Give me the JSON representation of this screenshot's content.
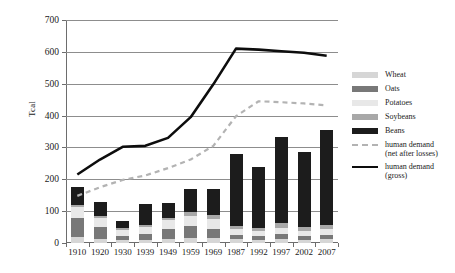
{
  "chart_data": {
    "type": "bar",
    "title": "",
    "xlabel": "",
    "ylabel": "Tcal",
    "ylim": [
      0,
      700
    ],
    "yticks": [
      0,
      100,
      200,
      300,
      400,
      500,
      600,
      700
    ],
    "grid": true,
    "legend_position": "right",
    "stacked": true,
    "categories": [
      "1910",
      "1920",
      "1930",
      "1939",
      "1949",
      "1959",
      "1969",
      "1987",
      "1992",
      "1997",
      "2002",
      "2007"
    ],
    "series": [
      {
        "name": "Wheat",
        "color": "#d6d6d6",
        "values": [
          18,
          12,
          8,
          10,
          14,
          16,
          15,
          12,
          10,
          12,
          10,
          12
        ]
      },
      {
        "name": "Oats",
        "color": "#787878",
        "values": [
          62,
          38,
          14,
          18,
          30,
          36,
          30,
          14,
          12,
          16,
          12,
          14
        ]
      },
      {
        "name": "Potatoes",
        "color": "#e8e8e8",
        "values": [
          32,
          30,
          20,
          22,
          28,
          34,
          30,
          18,
          16,
          20,
          16,
          18
        ]
      },
      {
        "name": "Soybeans",
        "color": "#a8a8a8",
        "values": [
          6,
          6,
          4,
          6,
          8,
          10,
          12,
          10,
          10,
          14,
          12,
          14
        ]
      },
      {
        "name": "Beans",
        "color": "#1c1c1c",
        "values": [
          57,
          44,
          24,
          66,
          45,
          74,
          83,
          226,
          192,
          272,
          236,
          297
        ]
      }
    ],
    "lines": [
      {
        "name": "human demand (net after losses)",
        "style": "dashed",
        "color": "#b3b3b3",
        "values": [
          148,
          175,
          198,
          212,
          235,
          262,
          305,
          398,
          445,
          442,
          438,
          432
        ]
      },
      {
        "name": "human demand (gross)",
        "style": "solid",
        "color": "#0d0d0d",
        "values": [
          215,
          262,
          302,
          305,
          330,
          395,
          498,
          610,
          607,
          602,
          597,
          588
        ]
      }
    ]
  },
  "legend": {
    "items": [
      {
        "label": "Wheat",
        "swatch": "wheat-swatch"
      },
      {
        "label": "Oats",
        "swatch": "oats-swatch"
      },
      {
        "label": "Potatoes",
        "swatch": "potatoes-swatch"
      },
      {
        "label": "Soybeans",
        "swatch": "soybeans-swatch"
      },
      {
        "label": "Beans",
        "swatch": "beans-swatch"
      },
      {
        "label": "human demand\n(net after losses)",
        "swatch": "dashed-line-swatch"
      },
      {
        "label": "human demand\n(gross)",
        "swatch": "solid-line-swatch"
      }
    ]
  }
}
